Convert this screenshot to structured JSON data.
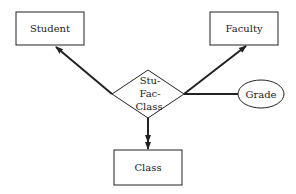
{
  "diagram": {
    "type": "entity-relationship",
    "entities": {
      "student": "Student",
      "faculty": "Faculty",
      "class": "Class"
    },
    "relationship": {
      "lines": [
        "Stu-",
        "Fac-",
        "Class"
      ]
    },
    "attribute": "Grade",
    "connections": [
      {
        "from": "Stu-Fac-Class",
        "to": "Student",
        "style": "arrow"
      },
      {
        "from": "Stu-Fac-Class",
        "to": "Faculty",
        "style": "arrow"
      },
      {
        "from": "Stu-Fac-Class",
        "to": "Class",
        "style": "double-arrow"
      },
      {
        "from": "Stu-Fac-Class",
        "to": "Grade",
        "style": "line"
      }
    ],
    "colors": {
      "stroke": "#222222",
      "fill": "#ffffff"
    }
  }
}
